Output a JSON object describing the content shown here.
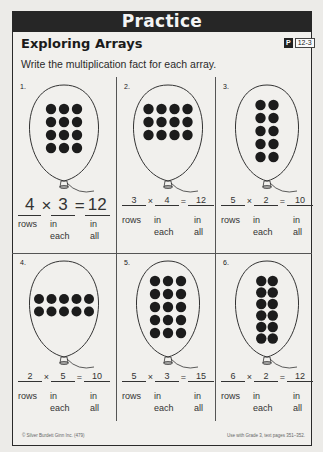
{
  "banner": {
    "title": "Practice"
  },
  "lesson": {
    "title": "Exploring Arrays",
    "code_prefix": "P",
    "code": "12-3"
  },
  "instructions": "Write the multiplication fact for each array.",
  "labels": {
    "rows": "rows",
    "in": "in",
    "each": "each",
    "all": "all",
    "times": "×",
    "equals": "="
  },
  "problems": [
    {
      "number": "1.",
      "rows": 4,
      "cols": 3,
      "answer_rows": "4",
      "answer_each": "3",
      "answer_total": "12",
      "handwritten": true
    },
    {
      "number": "2.",
      "rows": 3,
      "cols": 4,
      "answer_rows": "3",
      "answer_each": "4",
      "answer_total": "12",
      "handwritten": false
    },
    {
      "number": "3.",
      "rows": 5,
      "cols": 2,
      "answer_rows": "5",
      "answer_each": "2",
      "answer_total": "10",
      "handwritten": false
    },
    {
      "number": "4.",
      "rows": 2,
      "cols": 5,
      "answer_rows": "2",
      "answer_each": "5",
      "answer_total": "10",
      "handwritten": false
    },
    {
      "number": "5.",
      "rows": 5,
      "cols": 3,
      "answer_rows": "5",
      "answer_each": "3",
      "answer_total": "15",
      "handwritten": false
    },
    {
      "number": "6.",
      "rows": 6,
      "cols": 2,
      "answer_rows": "6",
      "answer_each": "2",
      "answer_total": "12",
      "handwritten": false
    }
  ],
  "footer": {
    "copyright": "© Silver Burdett Ginn Inc. (479)",
    "usage": "Use with Grade 3, text pages 351–352."
  },
  "colors": {
    "banner": "#262626",
    "dot": "#1c1c1c",
    "paper": "#f1f0ed"
  }
}
